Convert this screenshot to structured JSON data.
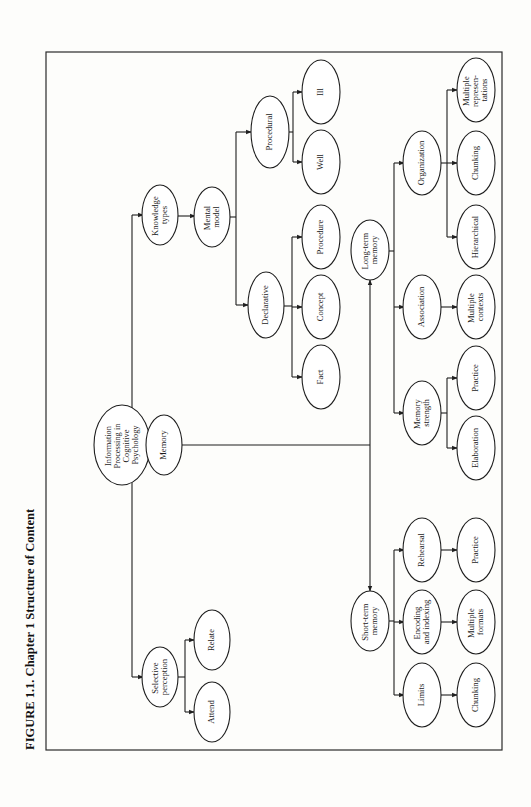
{
  "figure": {
    "title": "FIGURE 1.1.  Chapter 1 Structure of Content"
  },
  "nodes": {
    "root": {
      "lines": [
        "Information",
        "Processing in",
        "Cognitive",
        "Psychology"
      ]
    },
    "knowledge_types": {
      "lines": [
        "Knowledge",
        "types"
      ]
    },
    "mental_model": {
      "lines": [
        "Mental",
        "model"
      ]
    },
    "procedural": {
      "lines": [
        "Procedural"
      ]
    },
    "ill": {
      "lines": [
        "Ill"
      ]
    },
    "well": {
      "lines": [
        "Well"
      ]
    },
    "declarative": {
      "lines": [
        "Declarative"
      ]
    },
    "procedure": {
      "lines": [
        "Procedure"
      ]
    },
    "concept": {
      "lines": [
        "Concept"
      ]
    },
    "fact": {
      "lines": [
        "Fact"
      ]
    },
    "memory": {
      "lines": [
        "Memory"
      ]
    },
    "long_term_memory": {
      "lines": [
        "Long-term",
        "memory"
      ]
    },
    "organization": {
      "lines": [
        "Organization"
      ]
    },
    "multiple_representations": {
      "lines": [
        "Multiple",
        "represen-",
        "tations"
      ]
    },
    "chunking_org": {
      "lines": [
        "Chunking"
      ]
    },
    "hierarchical": {
      "lines": [
        "Hierarchical"
      ]
    },
    "association": {
      "lines": [
        "Association"
      ]
    },
    "multiple_contexts": {
      "lines": [
        "Multiple",
        "contexts"
      ]
    },
    "memory_strength": {
      "lines": [
        "Memory",
        "strength"
      ]
    },
    "practice_ltm": {
      "lines": [
        "Practice"
      ]
    },
    "elaboration": {
      "lines": [
        "Elaboration"
      ]
    },
    "short_term_memory": {
      "lines": [
        "Short-term",
        "memory"
      ]
    },
    "rehearsal": {
      "lines": [
        "Rehearsal"
      ]
    },
    "practice_stm": {
      "lines": [
        "Practice"
      ]
    },
    "encoding_indexing": {
      "lines": [
        "Encoding",
        "and indexing"
      ]
    },
    "multiple_formats": {
      "lines": [
        "Multiple",
        "formats"
      ]
    },
    "limits": {
      "lines": [
        "Limits"
      ]
    },
    "chunking_stm": {
      "lines": [
        "Chunking"
      ]
    },
    "selective_perception": {
      "lines": [
        "Selective",
        "perception"
      ]
    },
    "relate": {
      "lines": [
        "Relate"
      ]
    },
    "attend": {
      "lines": [
        "Attend"
      ]
    }
  },
  "colors": {
    "stroke": "#1e1e1e",
    "background": "#fdfdfb"
  }
}
